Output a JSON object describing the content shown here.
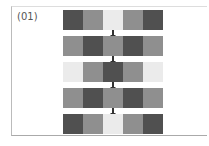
{
  "figure": {
    "label": "(01)",
    "colors": {
      "dark": "#505050",
      "mid": "#8f8f8f",
      "light": "#ebebeb"
    },
    "rows": [
      [
        "dark",
        "mid",
        "light",
        "mid",
        "dark"
      ],
      [
        "mid",
        "dark",
        "mid",
        "dark",
        "mid"
      ],
      [
        "light",
        "mid",
        "dark",
        "mid",
        "light"
      ],
      [
        "mid",
        "dark",
        "mid",
        "dark",
        "mid"
      ],
      [
        "dark",
        "mid",
        "light",
        "mid",
        "dark"
      ]
    ]
  }
}
